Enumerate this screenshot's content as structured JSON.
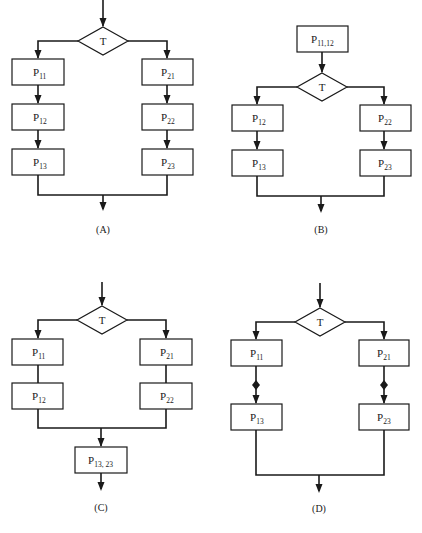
{
  "figure": {
    "panels": [
      {
        "id": "A",
        "caption": "(A)",
        "decision": "T",
        "left_branch": [
          {
            "main": "P",
            "sub": "11"
          },
          {
            "main": "P",
            "sub": "12"
          },
          {
            "main": "P",
            "sub": "13"
          }
        ],
        "right_branch": [
          {
            "main": "P",
            "sub": "21"
          },
          {
            "main": "P",
            "sub": "22"
          },
          {
            "main": "P",
            "sub": "23"
          }
        ]
      },
      {
        "id": "B",
        "caption": "(B)",
        "pre_decision": {
          "main": "P",
          "sub": "11,12"
        },
        "decision": "T",
        "left_branch": [
          {
            "main": "P",
            "sub": "12"
          },
          {
            "main": "P",
            "sub": "13"
          }
        ],
        "right_branch": [
          {
            "main": "P",
            "sub": "22"
          },
          {
            "main": "P",
            "sub": "23"
          }
        ]
      },
      {
        "id": "C",
        "caption": "(C)",
        "decision": "T",
        "left_branch": [
          {
            "main": "P",
            "sub": "11"
          },
          {
            "main": "P",
            "sub": "12"
          }
        ],
        "right_branch": [
          {
            "main": "P",
            "sub": "21"
          },
          {
            "main": "P",
            "sub": "22"
          }
        ],
        "post_join": {
          "main": "P",
          "sub": "13, 23"
        }
      },
      {
        "id": "D",
        "caption": "(D)",
        "decision": "T",
        "left_branch": [
          {
            "main": "P",
            "sub": "11"
          },
          {
            "main": "P",
            "sub": "13"
          }
        ],
        "right_branch": [
          {
            "main": "P",
            "sub": "21"
          },
          {
            "main": "P",
            "sub": "23"
          }
        ],
        "sync_marker": "diamond"
      }
    ]
  }
}
